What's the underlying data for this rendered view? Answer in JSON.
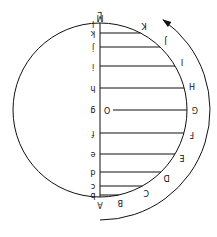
{
  "diagram": {
    "rotation_deg": 180,
    "circle": {
      "cx": 100,
      "cy": 110,
      "r": 87
    },
    "axis": {
      "x": 100,
      "top_label": "M",
      "bottom_label": "A"
    },
    "chords": [
      {
        "y": 23,
        "x_end": 117,
        "left": "l",
        "right": "L"
      },
      {
        "y": 33,
        "x_end": 143,
        "left": "k",
        "right": "K"
      },
      {
        "y": 47,
        "x_end": 161,
        "left": "j",
        "right": "J"
      },
      {
        "y": 66,
        "x_end": 174,
        "left": "i",
        "right": "I"
      },
      {
        "y": 88,
        "x_end": 183,
        "left": "h",
        "right": "H"
      },
      {
        "y": 110,
        "x_end": 187,
        "left": "g",
        "right": "G",
        "center_label": "O"
      },
      {
        "y": 133,
        "x_end": 183,
        "left": "f",
        "right": "F"
      },
      {
        "y": 154,
        "x_end": 174,
        "left": "e",
        "right": "E"
      },
      {
        "y": 172,
        "x_end": 160,
        "left": "d",
        "right": "D"
      },
      {
        "y": 186,
        "x_end": 142,
        "left": "c",
        "right": "C"
      },
      {
        "y": 195,
        "x_end": 122,
        "left": "b",
        "right": "B"
      }
    ],
    "outer_arc": {
      "label": "rotation-arrow"
    }
  }
}
